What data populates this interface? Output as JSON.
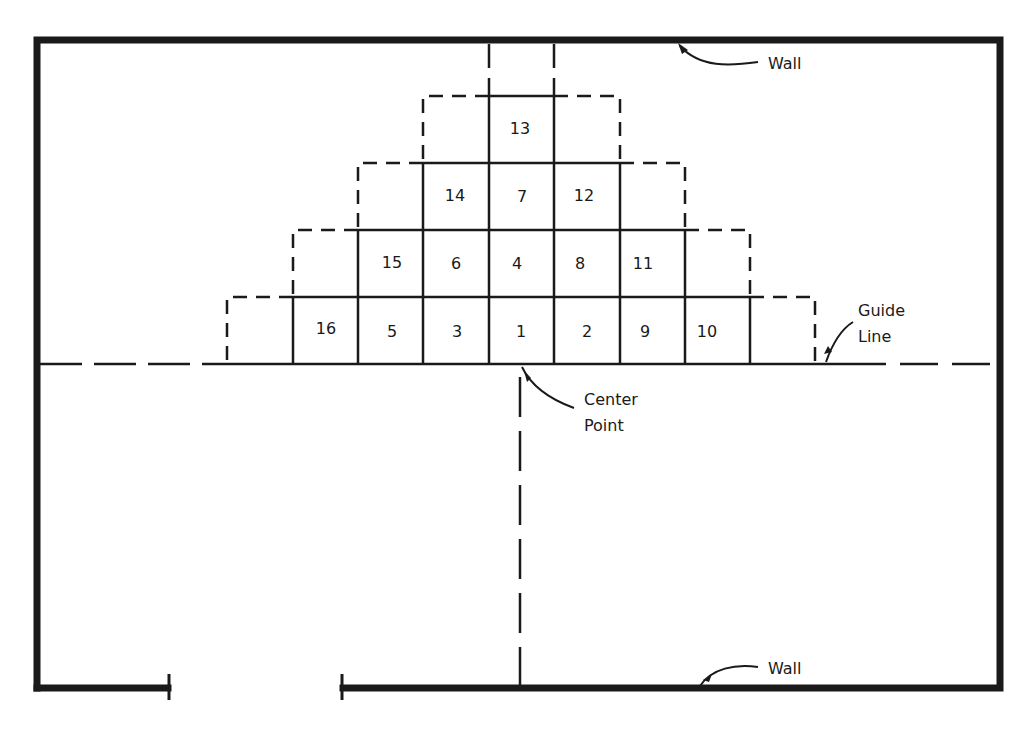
{
  "diagram": {
    "type": "floor-plan tile layout",
    "colors": {
      "ink": "#1a1a1a",
      "background": "#ffffff"
    },
    "labels": {
      "wall_top": "Wall",
      "wall_bottom": "Wall",
      "guide_line_1": "Guide",
      "guide_line_2": "Line",
      "center_point_1": "Center",
      "center_point_2": "Point"
    },
    "tiles": [
      {
        "number": "1",
        "row": 0,
        "col": 0
      },
      {
        "number": "2",
        "row": 0,
        "col": 1
      },
      {
        "number": "3",
        "row": 0,
        "col": -1
      },
      {
        "number": "4",
        "row": 1,
        "col": 0
      },
      {
        "number": "5",
        "row": 0,
        "col": -2
      },
      {
        "number": "6",
        "row": 1,
        "col": -1
      },
      {
        "number": "7",
        "row": 2,
        "col": 0
      },
      {
        "number": "8",
        "row": 1,
        "col": 1
      },
      {
        "number": "9",
        "row": 0,
        "col": 2
      },
      {
        "number": "10",
        "row": 0,
        "col": 3
      },
      {
        "number": "11",
        "row": 1,
        "col": 2
      },
      {
        "number": "12",
        "row": 2,
        "col": 1
      },
      {
        "number": "13",
        "row": 3,
        "col": 0
      },
      {
        "number": "14",
        "row": 2,
        "col": -1
      },
      {
        "number": "15",
        "row": 1,
        "col": -2
      },
      {
        "number": "16",
        "row": 0,
        "col": -3
      }
    ]
  }
}
